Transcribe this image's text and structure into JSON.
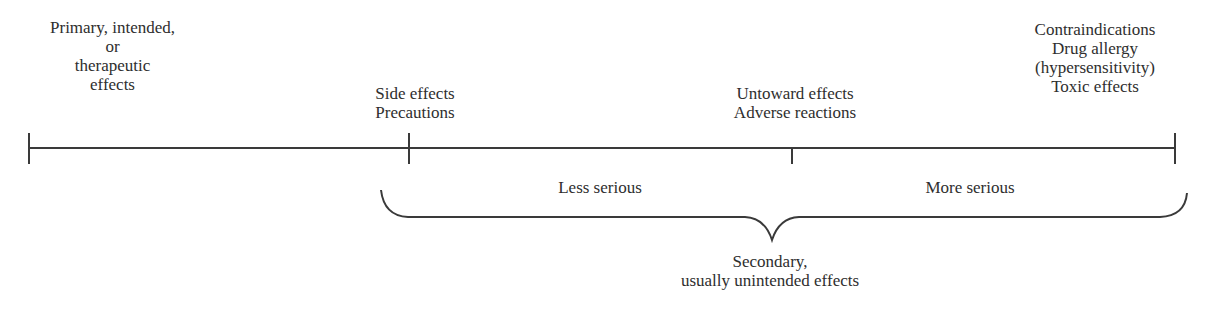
{
  "diagram": {
    "top_labels": [
      {
        "id": "primary",
        "lines": [
          "Primary, intended,",
          "or",
          "therapeutic",
          "effects"
        ]
      },
      {
        "id": "side",
        "lines": [
          "Side effects",
          "Precautions"
        ]
      },
      {
        "id": "untoward",
        "lines": [
          "Untoward effects",
          "Adverse reactions"
        ]
      },
      {
        "id": "contra",
        "lines": [
          "Contraindications",
          "Drug allergy",
          "(hypersensitivity)",
          "Toxic effects"
        ]
      }
    ],
    "segment_labels": {
      "less": "Less serious",
      "more": "More serious"
    },
    "brace_label": {
      "lines": [
        "Secondary,",
        "usually unintended effects"
      ]
    },
    "colors": {
      "ink": "#3a3a3a"
    }
  }
}
